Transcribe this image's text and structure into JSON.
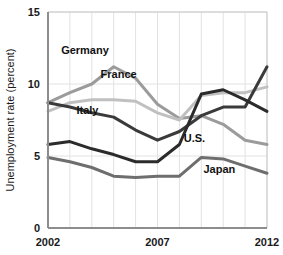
{
  "chart_data": {
    "type": "line",
    "title": "",
    "xlabel": "",
    "ylabel": "Unemployment rate (percent)",
    "xlim": [
      2002,
      2012
    ],
    "ylim": [
      0,
      15
    ],
    "yticks": [
      0,
      5,
      10,
      15
    ],
    "ytick_labels": [
      "0",
      "5",
      "10",
      "15"
    ],
    "xticks": [
      2002,
      2007,
      2012
    ],
    "xtick_labels": [
      "2002",
      "2007",
      "2012"
    ],
    "grid": "vertical-and-horizontal",
    "legend": "inline-labels",
    "x": [
      2002,
      2003,
      2004,
      2005,
      2006,
      2007,
      2008,
      2009,
      2010,
      2011,
      2012
    ],
    "series": [
      {
        "name": "Germany",
        "color": "#9b9b9b",
        "label": "Germany",
        "label_x": 2002.6,
        "label_y": 12.1,
        "values": [
          8.7,
          9.4,
          10.0,
          11.2,
          10.4,
          8.6,
          7.6,
          7.8,
          7.2,
          6.1,
          5.8
        ]
      },
      {
        "name": "France",
        "color": "#c0c0c0",
        "label": "France",
        "label_x": 2004.4,
        "label_y": 10.4,
        "values": [
          8.1,
          8.7,
          8.9,
          8.9,
          8.8,
          8.0,
          7.5,
          9.2,
          9.4,
          9.4,
          9.8
        ]
      },
      {
        "name": "Italy",
        "color": "#3a3a3a",
        "label": "Italy",
        "label_x": 2003.3,
        "label_y": 7.9,
        "values": [
          8.7,
          8.4,
          8.0,
          7.7,
          6.8,
          6.1,
          6.7,
          7.8,
          8.4,
          8.4,
          11.2
        ]
      },
      {
        "name": "U.S.",
        "color": "#2b2b2b",
        "label": "U.S.",
        "label_x": 2008.2,
        "label_y": 6.0,
        "values": [
          5.8,
          6.0,
          5.5,
          5.1,
          4.6,
          4.6,
          5.8,
          9.3,
          9.6,
          8.9,
          8.1
        ]
      },
      {
        "name": "Japan",
        "color": "#6e6e6e",
        "label": "Japan",
        "label_x": 2009.1,
        "label_y": 3.8,
        "values": [
          4.9,
          4.6,
          4.2,
          3.6,
          3.5,
          3.6,
          3.6,
          4.9,
          4.8,
          4.3,
          3.8
        ]
      }
    ]
  },
  "axes": {
    "y_axis_title": "Unemployment rate (percent)"
  }
}
